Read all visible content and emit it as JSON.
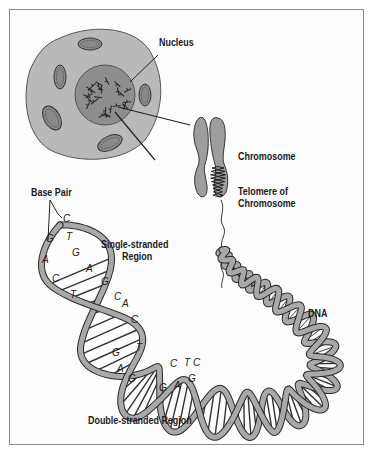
{
  "figure": {
    "labels": {
      "nucleus": "Nucleus",
      "chromosome": "Chromosome",
      "telomere_line1": "Telomere of",
      "telomere_line2": "Chromosome",
      "base_pair": "Base Pair",
      "single_line1": "Single-stranded",
      "single_line2": "Region",
      "dna": "DNA",
      "double_stranded": "Double-stranded Region"
    },
    "single_strand_bases": [
      {
        "pair": [
          "C",
          ""
        ]
      },
      {
        "pair": [
          "G",
          "T"
        ]
      },
      {
        "pair": [
          "A",
          "G"
        ]
      },
      {
        "pair": [
          "C",
          "A"
        ]
      },
      {
        "pair": [
          "T",
          "G"
        ]
      },
      {
        "pair": [
          "",
          "C"
        ]
      }
    ],
    "double_strand_bases_1": [
      "A",
      "C",
      "G",
      "T",
      "A",
      "G"
    ],
    "double_strand_bases_2": [
      "C",
      "T",
      "G",
      "A",
      "G",
      "C"
    ],
    "colors": {
      "cell": "#b8b8b8",
      "nucleus": "#8f8f8f",
      "strand": "#a9a9a9",
      "outline": "#2a2a2a",
      "text": "#1a1a1a"
    }
  }
}
